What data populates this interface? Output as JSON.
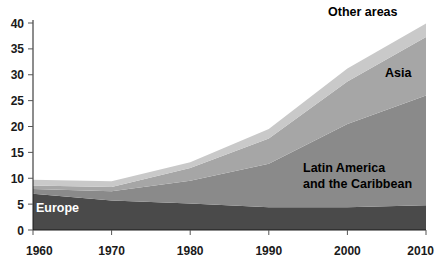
{
  "chart_data": {
    "type": "area",
    "stacked": true,
    "title": "",
    "subtitle": "",
    "xlabel": "",
    "ylabel": "",
    "x": [
      1960,
      1970,
      1980,
      1990,
      2000,
      2010
    ],
    "xlim": [
      1960,
      2010
    ],
    "ylim": [
      0,
      40
    ],
    "xticks": [
      1960,
      1970,
      1980,
      1990,
      2000,
      2010
    ],
    "yticks": [
      0,
      5,
      10,
      15,
      20,
      25,
      30,
      35,
      40
    ],
    "xtick_labels": [
      "1960",
      "1970",
      "1980",
      "1990",
      "2000",
      "2010"
    ],
    "ytick_labels": [
      "0",
      "5",
      "10",
      "15",
      "20",
      "25",
      "30",
      "35",
      "40"
    ],
    "grid": false,
    "legend_position": "inline-annotations",
    "series": [
      {
        "name": "Europe",
        "color": "#4a4a4a",
        "values": [
          7.0,
          5.7,
          5.1,
          4.4,
          4.4,
          4.8
        ]
      },
      {
        "name": "Latin America and the Caribbean",
        "color": "#8a8a8a",
        "values": [
          0.9,
          1.8,
          4.4,
          8.4,
          16.1,
          21.2
        ]
      },
      {
        "name": "Asia",
        "color": "#a6a6a6",
        "values": [
          0.7,
          0.8,
          2.5,
          4.9,
          8.2,
          11.3
        ]
      },
      {
        "name": "Other areas",
        "color": "#c9c9c9",
        "values": [
          1.1,
          1.1,
          1.1,
          1.8,
          2.5,
          2.6
        ]
      }
    ],
    "totals": [
      9.7,
      9.6,
      14.1,
      19.8,
      31.1,
      39.9
    ],
    "annotations": [
      {
        "text": "Other areas",
        "x_px": 328,
        "y_px": 16,
        "style": "dark"
      },
      {
        "text": "Asia",
        "x_px": 385,
        "y_px": 77,
        "style": "dark"
      },
      {
        "text": "Latin America",
        "x_px": 303,
        "y_px": 172,
        "style": "dark"
      },
      {
        "text": "and the Caribbean",
        "x_px": 303,
        "y_px": 188,
        "style": "dark"
      },
      {
        "text": "Europe",
        "x_px": 36,
        "y_px": 212,
        "style": "light"
      }
    ]
  },
  "axis": {
    "y_labels": [
      "40",
      "35",
      "30",
      "25",
      "20",
      "15",
      "10",
      "5",
      "0"
    ],
    "x_labels": [
      "1960",
      "1970",
      "1980",
      "1990",
      "2000",
      "2010"
    ]
  },
  "colors": {
    "europe": "#4a4a4a",
    "latin_america": "#8a8a8a",
    "asia": "#a6a6a6",
    "other_areas": "#c9c9c9",
    "axis": "#1a1a1a",
    "background": "#ffffff"
  },
  "labels": {
    "other_areas": "Other areas",
    "asia": "Asia",
    "latin_america_line1": "Latin America",
    "latin_america_line2": "and the Caribbean",
    "europe": "Europe"
  }
}
